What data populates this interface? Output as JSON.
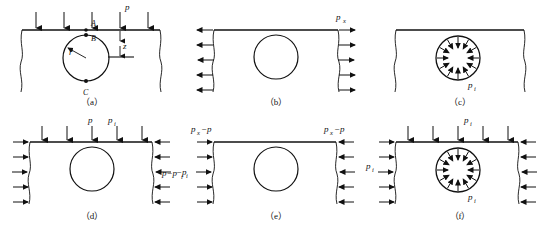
{
  "figure": {
    "title": "",
    "panels": [
      {
        "id": "a",
        "caption": "（a）",
        "description": "half-space with circular opening near surface under vertical surface load p",
        "labels": {
          "load": "p",
          "point_a": "A",
          "point_b": "B",
          "point_c": "C",
          "radius": "r",
          "depth": "z"
        },
        "top_arrow_count": 5,
        "arrow_direction": "down"
      },
      {
        "id": "b",
        "caption": "（b）",
        "description": "block with circular opening under horizontal outward lateral pressure",
        "labels": {
          "lateral": "p",
          "lateral_sub": "x"
        },
        "side_arrow_count": 5,
        "arrow_direction": "outward-horizontal"
      },
      {
        "id": "c",
        "caption": "（c）",
        "description": "block with circular opening under inward radial pressure on opening boundary",
        "labels": {
          "internal": "p",
          "internal_sub": "i"
        },
        "radial_arrow_count": 12,
        "arrow_direction": "inward-radial"
      },
      {
        "id": "d",
        "caption": "（d）",
        "description": "block with circular opening under vertical load and net lateral pressure",
        "labels": {
          "top_left": "p",
          "top_right": "p",
          "top_right_sub": "i",
          "side": "p−p",
          "side_sub": "i"
        },
        "top_arrow_count": 5,
        "side_arrow_count": 5,
        "arrow_direction": "down-and-inward"
      },
      {
        "id": "e",
        "caption": "（e）",
        "description": "block with circular opening under net horizontal pressure difference",
        "labels": {
          "corner_left": "p",
          "corner_left_sub": "x",
          "corner_left_rest": "−p",
          "corner_right": "p",
          "corner_right_sub": "x",
          "corner_right_rest": "−p",
          "side": "−p",
          "side_sub": "i"
        },
        "side_arrow_count": 5,
        "arrow_direction": "inward-horizontal"
      },
      {
        "id": "f",
        "caption": "（f）",
        "description": "block with circular opening under uniform pressure p_i on all boundaries and opening",
        "labels": {
          "top": "p",
          "top_sub": "i",
          "left": "p",
          "left_sub": "i",
          "hole": "p",
          "hole_sub": "i"
        },
        "top_arrow_count": 5,
        "side_arrow_count": 5,
        "radial_arrow_count": 12,
        "arrow_direction": "inward-all"
      }
    ]
  },
  "style": {
    "stroke": "#111111",
    "background": "#ffffff"
  }
}
